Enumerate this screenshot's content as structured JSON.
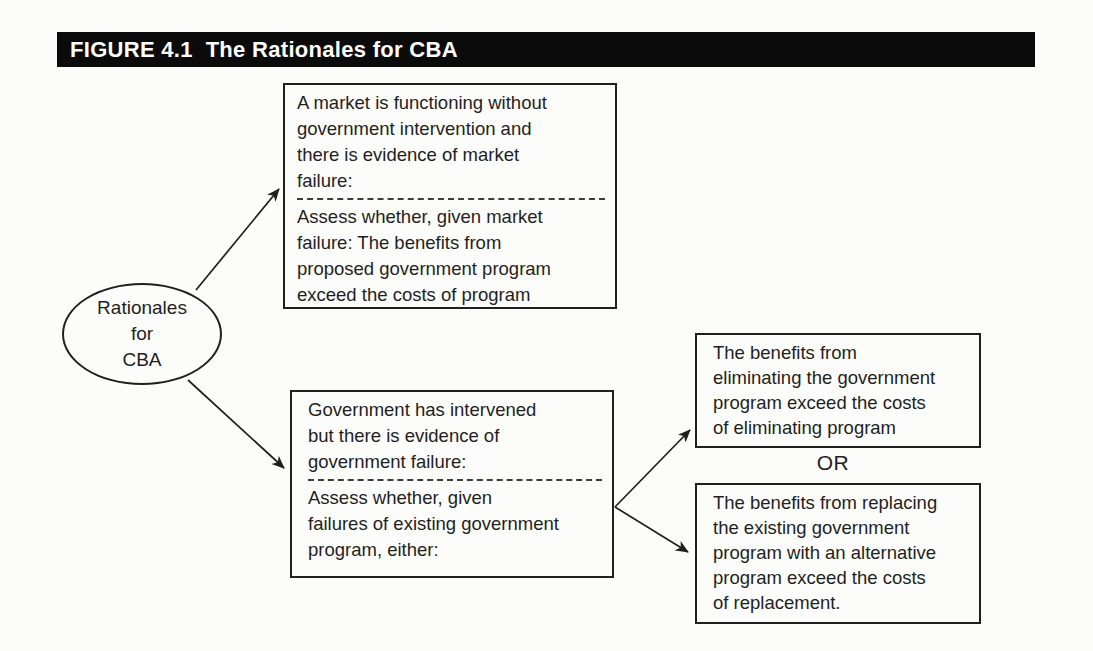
{
  "figure": {
    "title": "FIGURE 4.1  The Rationales for CBA"
  },
  "ellipse": {
    "label": "Rationales\nfor\nCBA"
  },
  "boxes": {
    "market": {
      "top": "A market is functioning without\ngovernment intervention and\nthere is evidence of market\nfailure:",
      "bottom": "Assess whether, given market\nfailure: The benefits from\nproposed government program\nexceed the costs of program"
    },
    "government": {
      "top": "Government has intervened\nbut there is evidence of\ngovernment failure:",
      "bottom": "Assess whether, given\nfailures of existing government\nprogram, either:"
    },
    "eliminate": {
      "text": "The benefits from\neliminating the government\nprogram exceed the costs\nof eliminating program"
    },
    "replace": {
      "text": "The benefits from replacing\nthe existing government\nprogram with an alternative\nprogram exceed the costs\nof replacement."
    }
  },
  "connector": {
    "or_label": "OR"
  },
  "colors": {
    "banner_bg": "#0b0b0b",
    "banner_text": "#ffffff",
    "diagram_line": "#1f1f1f",
    "page_bg": "#fcfcfa"
  }
}
